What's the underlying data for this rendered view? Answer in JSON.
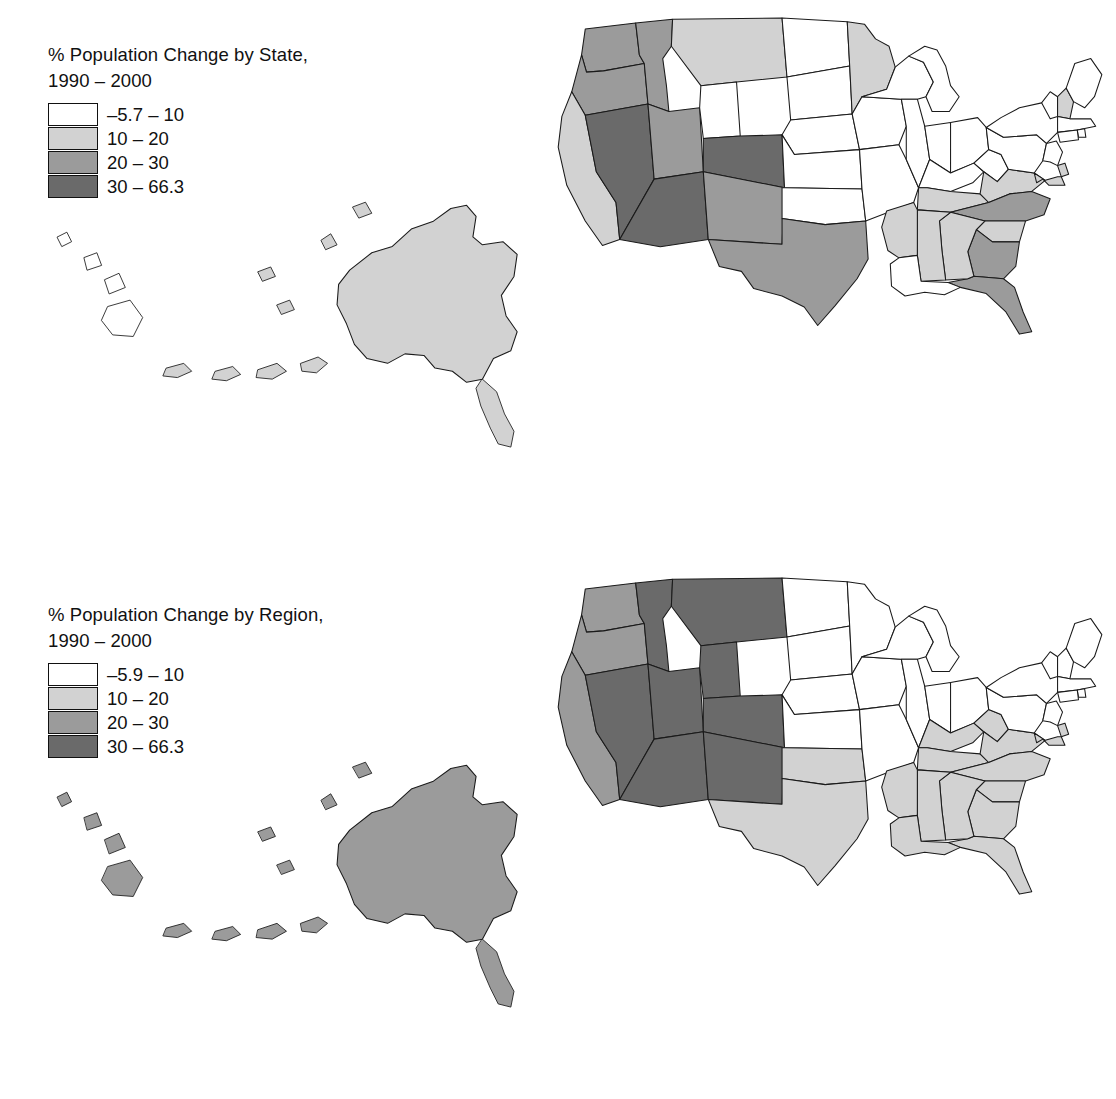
{
  "figure": {
    "background_color": "#ffffff",
    "outline_color": "#1a1a1a"
  },
  "palette": {
    "class1": "#ffffff",
    "class2": "#d2d2d2",
    "class3": "#9b9b9b",
    "class4": "#6a6a6a"
  },
  "panels": [
    {
      "id": "state",
      "legend": {
        "title_line1": "% Population Change by State,",
        "title_line2": "1990 – 2000",
        "items": [
          {
            "label": "–5.7 – 10",
            "color": "#ffffff"
          },
          {
            "label": "10 – 20",
            "color": "#d2d2d2"
          },
          {
            "label": "20 – 30",
            "color": "#9b9b9b"
          },
          {
            "label": "30 – 66.3",
            "color": "#6a6a6a"
          }
        ]
      }
    },
    {
      "id": "region",
      "legend": {
        "title_line1": "% Population Change by Region,",
        "title_line2": "1990 – 2000",
        "items": [
          {
            "label": "–5.9 – 10",
            "color": "#ffffff"
          },
          {
            "label": "10 – 20",
            "color": "#d2d2d2"
          },
          {
            "label": "20 – 30",
            "color": "#9b9b9b"
          },
          {
            "label": "30 – 66.3",
            "color": "#6a6a6a"
          }
        ]
      }
    }
  ],
  "chart_data": {
    "type": "map",
    "subtype": "choropleth",
    "unit": "percent change",
    "classes": [
      {
        "index": 1,
        "range": "–5.7 – 10",
        "min": -5.7,
        "max": 10,
        "color": "#ffffff"
      },
      {
        "index": 2,
        "range": "10 – 20",
        "min": 10,
        "max": 20,
        "color": "#d2d2d2"
      },
      {
        "index": 3,
        "range": "20 – 30",
        "min": 20,
        "max": 30,
        "color": "#9b9b9b"
      },
      {
        "index": 4,
        "range": "30 – 66.3",
        "min": 30,
        "max": 66.3,
        "color": "#6a6a6a"
      }
    ],
    "maps": [
      {
        "name": "by-state",
        "legend_title": "% Population Change by State, 1990 – 2000",
        "min_value": -5.7,
        "max_value": 66.3,
        "values": {
          "AL": 2,
          "AK": 2,
          "AZ": 4,
          "AR": 2,
          "CA": 2,
          "CO": 4,
          "CT": 1,
          "DE": 2,
          "FL": 3,
          "GA": 3,
          "HI": 1,
          "ID": 3,
          "IL": 1,
          "IN": 1,
          "IA": 1,
          "KS": 1,
          "KY": 1,
          "LA": 1,
          "ME": 1,
          "MD": 2,
          "MA": 1,
          "MI": 1,
          "MN": 2,
          "MS": 2,
          "MO": 1,
          "MT": 2,
          "NE": 1,
          "NV": 4,
          "NH": 2,
          "NJ": 1,
          "NM": 3,
          "NY": 1,
          "NC": 3,
          "ND": 1,
          "OH": 1,
          "OK": 1,
          "OR": 3,
          "PA": 1,
          "RI": 1,
          "SC": 2,
          "SD": 1,
          "TN": 2,
          "TX": 3,
          "UT": 3,
          "VT": 1,
          "VA": 2,
          "WA": 3,
          "WV": 1,
          "WI": 1,
          "WY": 1
        }
      },
      {
        "name": "by-region",
        "legend_title": "% Population Change by Region, 1990 – 2000",
        "min_value": -5.9,
        "max_value": 66.3,
        "regions": [
          {
            "name": "Pacific",
            "class": 3,
            "states": [
              "WA",
              "OR",
              "CA",
              "AK",
              "HI"
            ]
          },
          {
            "name": "Mountain",
            "class": 4,
            "states": [
              "ID",
              "MT",
              "WY",
              "NV",
              "UT",
              "CO",
              "AZ",
              "NM"
            ]
          },
          {
            "name": "Midwest",
            "class": 1,
            "states": [
              "ND",
              "SD",
              "NE",
              "KS",
              "MN",
              "IA",
              "MO",
              "WI",
              "IL",
              "MI",
              "IN",
              "OH"
            ]
          },
          {
            "name": "Northeast",
            "class": 1,
            "states": [
              "ME",
              "NH",
              "VT",
              "MA",
              "RI",
              "CT",
              "NY",
              "NJ",
              "PA"
            ]
          },
          {
            "name": "South",
            "class": 2,
            "states": [
              "TX",
              "OK",
              "AR",
              "LA",
              "MS",
              "AL",
              "TN",
              "KY",
              "WV",
              "VA",
              "MD",
              "DE",
              "NC",
              "SC",
              "GA",
              "FL"
            ]
          }
        ],
        "values": {
          "AL": 2,
          "AK": 3,
          "AZ": 4,
          "AR": 2,
          "CA": 3,
          "CO": 4,
          "CT": 1,
          "DE": 2,
          "FL": 2,
          "GA": 2,
          "HI": 3,
          "ID": 4,
          "IL": 1,
          "IN": 1,
          "IA": 1,
          "KS": 1,
          "KY": 2,
          "LA": 2,
          "ME": 1,
          "MD": 2,
          "MA": 1,
          "MI": 1,
          "MN": 1,
          "MS": 2,
          "MO": 1,
          "MT": 4,
          "NE": 1,
          "NV": 4,
          "NH": 1,
          "NJ": 1,
          "NM": 4,
          "NY": 1,
          "NC": 2,
          "ND": 1,
          "OH": 1,
          "OK": 2,
          "OR": 3,
          "PA": 1,
          "RI": 1,
          "SC": 2,
          "SD": 1,
          "TN": 2,
          "TX": 2,
          "UT": 4,
          "VT": 1,
          "VA": 2,
          "WA": 3,
          "WV": 2,
          "WI": 1,
          "WY": 4
        }
      }
    ]
  }
}
